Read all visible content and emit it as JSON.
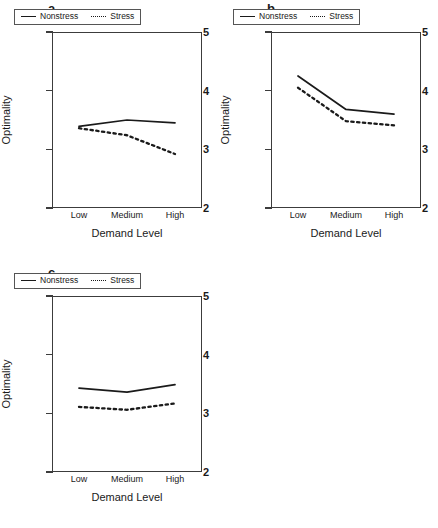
{
  "figure": {
    "panels": [
      "a",
      "b",
      "c"
    ],
    "axis_title_x": "Demand Level",
    "axis_title_y": "Optimality",
    "legend": {
      "nonstress_label": "Nonstress",
      "stress_label": "Stress"
    },
    "y_ticks": [
      "5",
      "4",
      "3",
      "2"
    ],
    "x_ticks": [
      "Low",
      "Medium",
      "High"
    ]
  },
  "chart_data": [
    {
      "type": "line",
      "panel": "a",
      "title": "a",
      "xlabel": "Demand Level",
      "ylabel": "Optimality",
      "categories": [
        "Low",
        "Medium",
        "High"
      ],
      "ylim": [
        2,
        5
      ],
      "yticks": [
        2,
        3,
        4,
        5
      ],
      "grid": false,
      "legend_position": "top-left-inside",
      "series": [
        {
          "name": "Nonstress",
          "style": "solid",
          "values": [
            3.39,
            3.5,
            3.45
          ]
        },
        {
          "name": "Stress",
          "style": "dotted",
          "values": [
            3.36,
            3.24,
            2.92
          ]
        }
      ]
    },
    {
      "type": "line",
      "panel": "b",
      "title": "b",
      "xlabel": "Demand Level",
      "ylabel": "Optimality",
      "categories": [
        "Low",
        "Medium",
        "High"
      ],
      "ylim": [
        2,
        5
      ],
      "yticks": [
        2,
        3,
        4,
        5
      ],
      "grid": false,
      "legend_position": "top-left-inside",
      "series": [
        {
          "name": "Nonstress",
          "style": "solid",
          "values": [
            4.25,
            3.68,
            3.6
          ]
        },
        {
          "name": "Stress",
          "style": "dotted",
          "values": [
            4.05,
            3.48,
            3.41
          ]
        }
      ]
    },
    {
      "type": "line",
      "panel": "c",
      "title": "c",
      "xlabel": "Demand Level",
      "ylabel": "Optimality",
      "categories": [
        "Low",
        "Medium",
        "High"
      ],
      "ylim": [
        2,
        5
      ],
      "yticks": [
        2,
        3,
        4,
        5
      ],
      "grid": false,
      "legend_position": "top-left-inside",
      "series": [
        {
          "name": "Nonstress",
          "style": "solid",
          "values": [
            3.43,
            3.36,
            3.49
          ]
        },
        {
          "name": "Stress",
          "style": "dotted",
          "values": [
            3.11,
            3.06,
            3.17
          ]
        }
      ]
    }
  ]
}
